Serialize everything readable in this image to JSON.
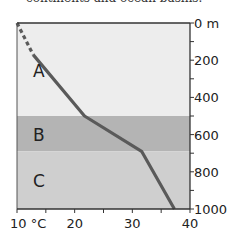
{
  "caption": "continents and ocean basins.",
  "chart_data": {
    "type": "line",
    "title": "",
    "xlabel": "°C",
    "ylabel": "m",
    "xlim": [
      10,
      40
    ],
    "ylim": [
      0,
      1000
    ],
    "y_inverted": true,
    "x_ticks": [
      10,
      15,
      20,
      25,
      30,
      35,
      40
    ],
    "x_tick_labels": [
      "10 °C",
      "20",
      "30",
      "40"
    ],
    "x_tick_label_values": [
      10,
      20,
      30,
      40
    ],
    "y_ticks": [
      0,
      100,
      200,
      300,
      400,
      500,
      600,
      700,
      800,
      900,
      1000
    ],
    "y_tick_labels": [
      "0 m",
      "200",
      "400",
      "600",
      "800",
      "1000"
    ],
    "y_tick_label_values": [
      0,
      200,
      400,
      600,
      800,
      1000
    ],
    "layers": [
      {
        "label": "A",
        "from": 0,
        "to": 500,
        "color": "#ededed"
      },
      {
        "label": "B",
        "from": 500,
        "to": 690,
        "color": "#b4b4b4"
      },
      {
        "label": "C",
        "from": 690,
        "to": 1000,
        "color": "#cfcfcf"
      }
    ],
    "series": [
      {
        "name": "temperature profile (dashed)",
        "style": "dashed",
        "color": "#5a5a5a",
        "points": [
          [
            10,
            0
          ],
          [
            12.8,
            170
          ]
        ]
      },
      {
        "name": "temperature profile",
        "style": "solid",
        "color": "#5a5a5a",
        "points": [
          [
            12.8,
            170
          ],
          [
            21.7,
            500
          ],
          [
            31.6,
            690
          ],
          [
            37.3,
            1000
          ]
        ]
      }
    ],
    "grid": false,
    "legend": "none"
  }
}
